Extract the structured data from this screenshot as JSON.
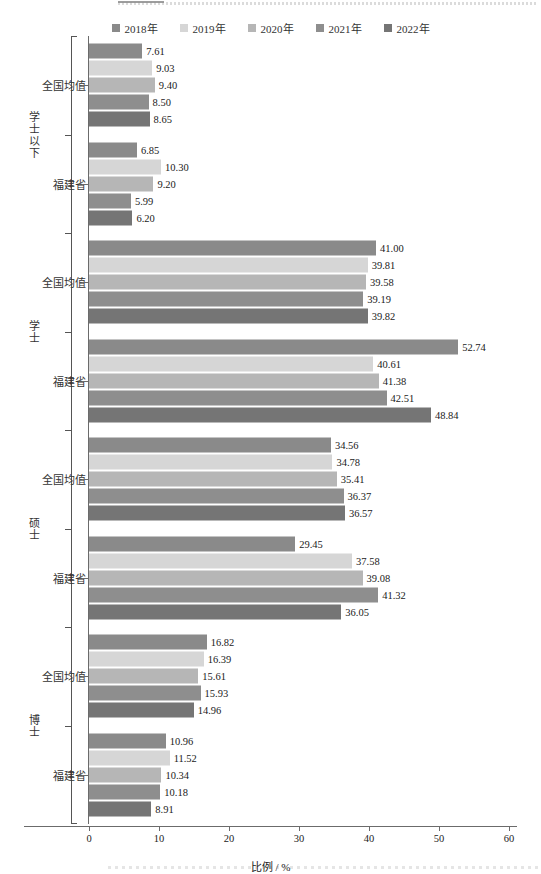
{
  "legend": {
    "position": "top-center",
    "items": [
      {
        "label": "2018年",
        "color": "#8a8a8a"
      },
      {
        "label": "2019年",
        "color": "#d6d6d6"
      },
      {
        "label": "2020年",
        "color": "#b6b6b6"
      },
      {
        "label": "2021年",
        "color": "#8e8e8e"
      },
      {
        "label": "2022年",
        "color": "#757575"
      }
    ]
  },
  "axis": {
    "xlabel": "比例 / %",
    "xticks": [
      "0",
      "10",
      "20",
      "30",
      "40",
      "50",
      "60"
    ],
    "xmin": 0,
    "xmax": 60
  },
  "chart_data": {
    "type": "bar",
    "orientation": "horizontal",
    "title": "",
    "xlabel": "比例 / %",
    "ylabel": "",
    "xlim": [
      0,
      60
    ],
    "grid": false,
    "legend_position": "top-center",
    "categories": [
      "学士以下",
      "学士",
      "硕士",
      "博士"
    ],
    "subcategories": [
      "全国均值",
      "福建省"
    ],
    "series": [
      {
        "name": "2018年",
        "color": "#8a8a8a",
        "values": {
          "学士以下": {
            "全国均值": 7.61,
            "福建省": 6.85
          },
          "学士": {
            "全国均值": 41.0,
            "福建省": 52.74
          },
          "硕士": {
            "全国均值": 34.56,
            "福建省": 29.45
          },
          "博士": {
            "全国均值": 16.82,
            "福建省": 10.96
          }
        }
      },
      {
        "name": "2019年",
        "color": "#d6d6d6",
        "values": {
          "学士以下": {
            "全国均值": 9.03,
            "福建省": 10.3
          },
          "学士": {
            "全国均值": 39.81,
            "福建省": 40.61
          },
          "硕士": {
            "全国均值": 34.78,
            "福建省": 37.58
          },
          "博士": {
            "全国均值": 16.39,
            "福建省": 11.52
          }
        }
      },
      {
        "name": "2020年",
        "color": "#b6b6b6",
        "values": {
          "学士以下": {
            "全国均值": 9.4,
            "福建省": 9.2
          },
          "学士": {
            "全国均值": 39.58,
            "福建省": 41.38
          },
          "硕士": {
            "全国均值": 35.41,
            "福建省": 39.08
          },
          "博士": {
            "全国均值": 15.61,
            "福建省": 10.34
          }
        }
      },
      {
        "name": "2021年",
        "color": "#8e8e8e",
        "values": {
          "学士以下": {
            "全国均值": 8.5,
            "福建省": 5.99
          },
          "学士": {
            "全国均值": 39.19,
            "福建省": 42.51
          },
          "硕士": {
            "全国均值": 36.37,
            "福建省": 41.32
          },
          "博士": {
            "全国均值": 15.93,
            "福建省": 10.18
          }
        }
      },
      {
        "name": "2022年",
        "color": "#757575",
        "values": {
          "学士以下": {
            "全国均值": 8.65,
            "福建省": 6.2
          },
          "学士": {
            "全国均值": 39.82,
            "福建省": 48.84
          },
          "硕士": {
            "全国均值": 36.57,
            "福建省": 36.05
          },
          "博士": {
            "全国均值": 14.96,
            "福建省": 8.91
          }
        }
      }
    ],
    "data_labels": [
      {
        "group": "学士以下",
        "sub": "全国均值",
        "labels": [
          "7.61",
          "9.03",
          "9.40",
          "8.50",
          "8.65"
        ]
      },
      {
        "group": "学士以下",
        "sub": "福建省",
        "labels": [
          "6.85",
          "10.30",
          "9.20",
          "5.99",
          "6.20"
        ]
      },
      {
        "group": "学士",
        "sub": "全国均值",
        "labels": [
          "41.00",
          "39.81",
          "39.58",
          "39.19",
          "39.82"
        ]
      },
      {
        "group": "学士",
        "sub": "福建省",
        "labels": [
          "52.74",
          "40.61",
          "41.38",
          "42.51",
          "48.84"
        ]
      },
      {
        "group": "硕士",
        "sub": "全国均值",
        "labels": [
          "34.56",
          "34.78",
          "35.41",
          "36.37",
          "36.57"
        ]
      },
      {
        "group": "硕士",
        "sub": "福建省",
        "labels": [
          "29.45",
          "37.58",
          "39.08",
          "41.32",
          "36.05"
        ]
      },
      {
        "group": "博士",
        "sub": "全国均值",
        "labels": [
          "16.82",
          "16.39",
          "15.61",
          "15.93",
          "14.96"
        ]
      },
      {
        "group": "博士",
        "sub": "福建省",
        "labels": [
          "10.96",
          "11.52",
          "10.34",
          "10.18",
          "8.91"
        ]
      }
    ]
  }
}
